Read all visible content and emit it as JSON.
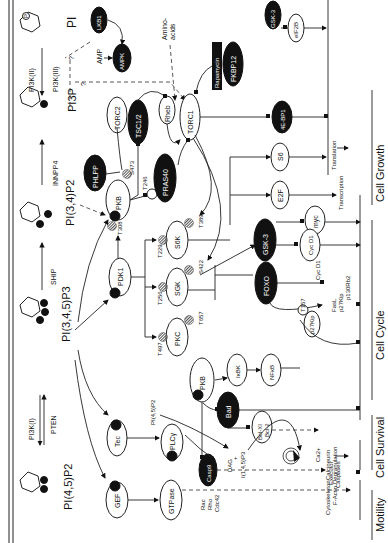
{
  "membrane": {
    "lipids": [
      {
        "label": "PI",
        "pos": 0
      },
      {
        "label": "PI3P",
        "pos": 1
      },
      {
        "label": "PI(3,4)P2",
        "pos": 2
      },
      {
        "label": "PI(3,4,5)P3",
        "pos": 3
      },
      {
        "label": "PI(4,5)P2",
        "pos": 4
      }
    ],
    "enzymes": [
      "PI3K(II)",
      "PI3K(III)",
      "INNPP4",
      "SHIP",
      "PI3K(I)",
      "PTEN"
    ],
    "p_label": "P"
  },
  "nodes": {
    "lkb1": "LKB1",
    "ampk": "AMPK",
    "amp": "AMP",
    "amino_acids_1": "Amino-",
    "amino_acids_2": "acids",
    "gsk3_top": "GSK-3",
    "eif2b": "eIF2B",
    "torc2": "TORC2",
    "tsc12": "TSC1/2",
    "rheb": "Rheb",
    "torc1": "TORC1",
    "rapamycin": "Rapamycin",
    "fkbp12": "FKBP12",
    "ebp1": "4E-BP1",
    "phlpp": "PHLPP",
    "pkb": "PKB",
    "pras40": "PRAS40",
    "s6": "S6",
    "e2f": "E2F",
    "pdk1": "PDK1",
    "s6k": "S6K",
    "sgk": "SGK",
    "pkc": "PKC",
    "gsk3": "GSK-3",
    "myc": "myc",
    "cycd1": "Cyc D1",
    "foxo": "FOXO",
    "pkb2": "PKB",
    "ikbk": "IκBK",
    "nfkb": "NFκB",
    "p27": "p27Kip",
    "bad": "Bad",
    "bclxl": "Bcl-XI",
    "bcl2": "Bcl-2",
    "casp9": "Casp9",
    "tec": "Tec",
    "plcy": "PLCγ",
    "gef": "GEF",
    "gtpase": "GTPase",
    "pi45p2_small": "PI(4,5)P2",
    "dag": "DAG",
    "plus": "+",
    "ip3": "I(1,4,5)P3",
    "ca": "Ca2+",
    "rac": "Rac",
    "rho": "Rho",
    "cdc42": "Cdc42",
    "question": "?"
  },
  "sites": {
    "s473": "S473",
    "t308": "T308",
    "t246": "T246",
    "t389": "T389",
    "t229": "T229",
    "s422": "S422",
    "t256": "T256",
    "t657": "T657",
    "t497": "T497",
    "t157": "T157"
  },
  "outputs": {
    "translation": "Translation",
    "transcription": "Transcription",
    "cycd1_out": "Cyc D1",
    "fasl": "FasL",
    "p27_out": "p27Kip",
    "p130": "p130Rb2",
    "executor1": "Executor",
    "executor2": "Caspases",
    "calcineurin": "Calcineurin",
    "degranulation": "Degranulation",
    "cytoskeleton": "Cytoskeleton",
    "factin": "F-Actin"
  },
  "categories": {
    "growth": "Cell Growth",
    "cycle": "Cell Cycle",
    "survival": "Cell Survival",
    "motility": "Motility"
  }
}
